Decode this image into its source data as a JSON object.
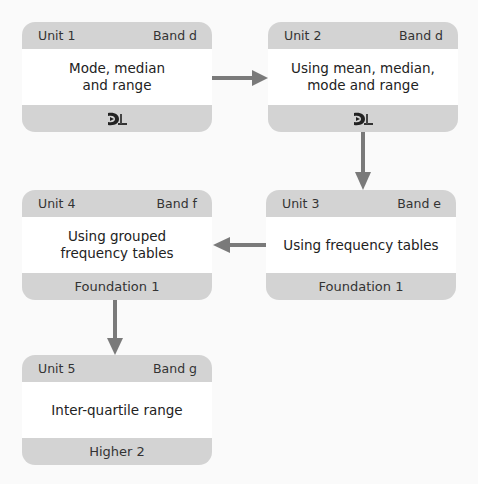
{
  "colors": {
    "background": "#fafafa",
    "box_band": "#d3d3d3",
    "box_body": "#ffffff",
    "arrow": "#7a7a7a"
  },
  "units": [
    {
      "unit": "Unit 1",
      "band": "Band d",
      "title": "Mode, median\nand range",
      "footer": "",
      "footer_icon": "dl-logo-icon"
    },
    {
      "unit": "Unit 2",
      "band": "Band d",
      "title": "Using mean, median,\nmode and range",
      "footer": "",
      "footer_icon": "dl-logo-icon"
    },
    {
      "unit": "Unit 3",
      "band": "Band e",
      "title": "Using frequency tables",
      "footer": "Foundation 1"
    },
    {
      "unit": "Unit 4",
      "band": "Band f",
      "title": "Using grouped\nfrequency tables",
      "footer": "Foundation 1"
    },
    {
      "unit": "Unit 5",
      "band": "Band g",
      "title": "Inter-quartile range",
      "footer": "Higher 2"
    }
  ],
  "arrows": [
    {
      "from": "Unit 1",
      "to": "Unit 2",
      "direction": "right"
    },
    {
      "from": "Unit 2",
      "to": "Unit 3",
      "direction": "down"
    },
    {
      "from": "Unit 3",
      "to": "Unit 4",
      "direction": "left"
    },
    {
      "from": "Unit 4",
      "to": "Unit 5",
      "direction": "down"
    }
  ]
}
